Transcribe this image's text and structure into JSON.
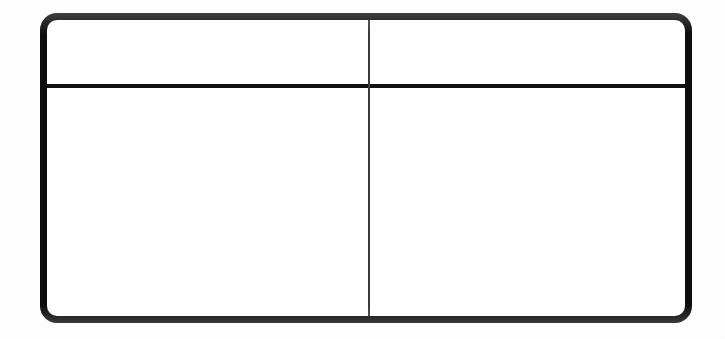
{
  "document": {
    "kind": "blank-form-grid",
    "background_color": "#ffffff",
    "ink_color": "#0d0d0d",
    "divider_color": "#3a3a3a"
  },
  "frame": {
    "border_width_px": 7,
    "corner_radius_px": 17,
    "x_px": 40,
    "y_px": 13,
    "width_px": 652,
    "height_px": 310
  },
  "dividers": {
    "horizontal": {
      "name": "row-divider",
      "y_px": 84,
      "thickness_px": 4,
      "color": "#101010"
    },
    "vertical": {
      "name": "column-divider",
      "x_px": 368,
      "thickness_px": 2,
      "color": "#3a3a3a"
    }
  },
  "grid": {
    "rows": 2,
    "columns": 2,
    "cells": [
      {
        "id": "header-left",
        "row": 1,
        "column": 1,
        "text": ""
      },
      {
        "id": "header-right",
        "row": 1,
        "column": 2,
        "text": ""
      },
      {
        "id": "body-left",
        "row": 2,
        "column": 1,
        "text": ""
      },
      {
        "id": "body-right",
        "row": 2,
        "column": 2,
        "text": ""
      }
    ]
  }
}
